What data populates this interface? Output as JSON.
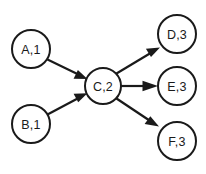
{
  "diagram": {
    "background_color": "#ffffff",
    "stroke_color": "#1a1a1a",
    "node_fill_color": "#ffffff",
    "nodes": [
      {
        "id": "A",
        "label": "A,1",
        "name": "A",
        "level": "1",
        "cx": 31,
        "cy": 49,
        "r": 19
      },
      {
        "id": "B",
        "label": "B,1",
        "name": "B",
        "level": "1",
        "cx": 31,
        "cy": 124,
        "r": 19
      },
      {
        "id": "C",
        "label": "C,2",
        "name": "C",
        "level": "2",
        "cx": 103,
        "cy": 86,
        "r": 18
      },
      {
        "id": "D",
        "label": "D,3",
        "name": "D",
        "level": "3",
        "cx": 177,
        "cy": 34,
        "r": 19
      },
      {
        "id": "E",
        "label": "E,3",
        "name": "E",
        "level": "3",
        "cx": 177,
        "cy": 86,
        "r": 19
      },
      {
        "id": "F",
        "label": "F,3",
        "name": "F",
        "level": "3",
        "cx": 177,
        "cy": 141,
        "r": 19
      }
    ],
    "edges": [
      {
        "id": "A-C",
        "from": "A",
        "to": "C",
        "label": "",
        "arrow": "directed"
      },
      {
        "id": "B-C",
        "from": "B",
        "to": "C",
        "label": "",
        "arrow": "directed"
      },
      {
        "id": "C-D",
        "from": "C",
        "to": "D",
        "label": "",
        "arrow": "directed"
      },
      {
        "id": "C-E",
        "from": "C",
        "to": "E",
        "label": "",
        "arrow": "directed"
      },
      {
        "id": "C-F",
        "from": "C",
        "to": "F",
        "label": "",
        "arrow": "directed"
      }
    ]
  }
}
